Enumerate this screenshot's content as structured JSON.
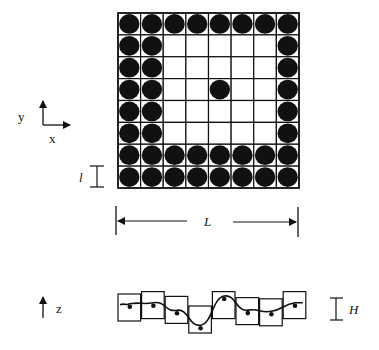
{
  "grid": {
    "rows": 8,
    "cols": 8,
    "occupancy": [
      [
        1,
        1,
        1,
        1,
        1,
        1,
        1,
        1
      ],
      [
        1,
        1,
        0,
        0,
        0,
        0,
        0,
        1
      ],
      [
        1,
        1,
        0,
        0,
        0,
        0,
        0,
        1
      ],
      [
        1,
        1,
        0,
        0,
        1,
        0,
        0,
        1
      ],
      [
        1,
        1,
        0,
        0,
        0,
        0,
        0,
        1
      ],
      [
        1,
        1,
        0,
        0,
        0,
        0,
        0,
        1
      ],
      [
        1,
        1,
        1,
        1,
        1,
        1,
        1,
        1
      ],
      [
        1,
        1,
        1,
        1,
        1,
        1,
        1,
        1
      ]
    ]
  },
  "axes_top": {
    "y_label": "y",
    "x_label": "x"
  },
  "dimension_cell": {
    "label": "l"
  },
  "dimension_length": {
    "label": "L"
  },
  "axes_side": {
    "z_label": "z"
  },
  "dimension_height": {
    "label": "H"
  },
  "side_view": {
    "box_count": 8,
    "box_vertical_offsets": [
      0,
      -0.1,
      0.1,
      0.5,
      -0.1,
      0.15,
      0.2,
      -0.1
    ],
    "dot_levels": [
      0.6,
      0.55,
      0.45,
      0.25,
      0.8,
      0.5,
      0.5,
      0.55
    ]
  },
  "colors": {
    "ink": "#111111",
    "background": "#ffffff"
  }
}
